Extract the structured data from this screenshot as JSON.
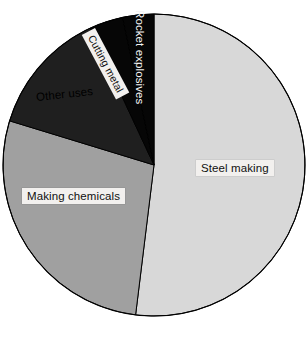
{
  "chart_data": {
    "type": "pie",
    "title": "",
    "subtitle": "",
    "xlabel": "",
    "ylabel": "",
    "legend_position": "none",
    "grid": false,
    "labels_on_slices": true,
    "start_angle_deg": 0,
    "direction": "clockwise",
    "categories": [
      "Steel making",
      "Making chemicals",
      "Other uses",
      "Cutting metal",
      "Rocket explosives"
    ],
    "values": [
      52,
      28,
      13,
      4,
      3
    ],
    "units": "percent",
    "slices": [
      {
        "name": "Steel making",
        "value": 52,
        "start_angle_deg": 0,
        "end_angle_deg": 187,
        "color": "#d8d8d8",
        "label_style": "boxed-dark-text"
      },
      {
        "name": "Making chemicals",
        "value": 28,
        "start_angle_deg": 187,
        "end_angle_deg": 287,
        "color": "#a0a0a0",
        "label_style": "boxed-dark-text"
      },
      {
        "name": "Other uses",
        "value": 13,
        "start_angle_deg": 287,
        "end_angle_deg": 335,
        "color": "#1f1f1f",
        "label_style": "plain-dark-text"
      },
      {
        "name": "Cutting metal",
        "value": 4,
        "start_angle_deg": 335,
        "end_angle_deg": 348,
        "color": "#060606",
        "label_style": "boxed-dark-text-rotated"
      },
      {
        "name": "Rocket explosives",
        "value": 3,
        "start_angle_deg": 348,
        "end_angle_deg": 360,
        "color": "#060606",
        "label_style": "plain-light-text-rotated"
      }
    ],
    "geometry": {
      "center_x": 154,
      "center_y": 165,
      "radius": 151,
      "outline_color": "#000000"
    }
  },
  "labels": {
    "steel_making": "Steel making",
    "making_chemicals": "Making chemicals",
    "other_uses": "Other uses",
    "cutting_metal": "Cutting metal",
    "rocket_explosives": "Rocket explosives"
  },
  "colors": {
    "steel_making": "#d8d8d8",
    "making_chemicals": "#a0a0a0",
    "other_uses": "#1f1f1f",
    "cutting_metal": "#060606",
    "rocket_explosives": "#060606",
    "background": "#ffffff",
    "outline": "#000000",
    "label_box": "#f2f0ee"
  }
}
